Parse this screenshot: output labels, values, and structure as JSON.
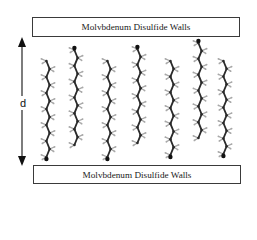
{
  "diagram": {
    "top_wall_label": "Molvbdenum Disulfide Walls",
    "bottom_wall_label": "Molvbdenum Disulfide Walls",
    "separation_label": "d",
    "colors": {
      "wall_border": "#3a3a3a",
      "carbon": "#2a2a2a",
      "hydrogen": "#a8a8a8",
      "head_group": "#111111",
      "arrow": "#111111"
    },
    "chains": [
      {
        "x": 48,
        "top": 61,
        "bottom": 157,
        "head": "bottom"
      },
      {
        "x": 76,
        "top": 50,
        "bottom": 145,
        "head": "top"
      },
      {
        "x": 109,
        "top": 61,
        "bottom": 157,
        "head": "bottom"
      },
      {
        "x": 139,
        "top": 49,
        "bottom": 143,
        "head": "top"
      },
      {
        "x": 172,
        "top": 61,
        "bottom": 155,
        "head": "bottom"
      },
      {
        "x": 200,
        "top": 43,
        "bottom": 138,
        "head": "top"
      },
      {
        "x": 225,
        "top": 61,
        "bottom": 154,
        "head": "bottom"
      }
    ]
  }
}
